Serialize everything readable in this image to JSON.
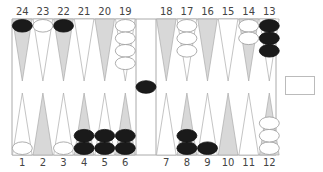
{
  "game": "backgammon",
  "colors": {
    "black_checker": "#1a1a1a",
    "white_checker": "#ffffff",
    "dark_point": "#d8d8d8",
    "light_point": "#ffffff",
    "board_line": "#aaaaaa",
    "label": "#444444"
  },
  "top_labels": [
    "24",
    "23",
    "22",
    "21",
    "20",
    "19",
    "18",
    "17",
    "16",
    "15",
    "14",
    "13"
  ],
  "bottom_labels": [
    "1",
    "2",
    "3",
    "4",
    "5",
    "6",
    "7",
    "8",
    "9",
    "10",
    "11",
    "12"
  ],
  "points": {
    "1": {
      "color": "white",
      "count": 1
    },
    "2": {
      "color": "none",
      "count": 0
    },
    "3": {
      "color": "white",
      "count": 1
    },
    "4": {
      "color": "black",
      "count": 2
    },
    "5": {
      "color": "black",
      "count": 2
    },
    "6": {
      "color": "black",
      "count": 2
    },
    "7": {
      "color": "none",
      "count": 0
    },
    "8": {
      "color": "black",
      "count": 2
    },
    "9": {
      "color": "black",
      "count": 1
    },
    "10": {
      "color": "none",
      "count": 0
    },
    "11": {
      "color": "none",
      "count": 0
    },
    "12": {
      "color": "white",
      "count": 3
    },
    "13": {
      "color": "black",
      "count": 3
    },
    "14": {
      "color": "white",
      "count": 2
    },
    "15": {
      "color": "none",
      "count": 0
    },
    "16": {
      "color": "none",
      "count": 0
    },
    "17": {
      "color": "white",
      "count": 3
    },
    "18": {
      "color": "none",
      "count": 0
    },
    "19": {
      "color": "white",
      "count": 4
    },
    "20": {
      "color": "none",
      "count": 0
    },
    "21": {
      "color": "none",
      "count": 0
    },
    "22": {
      "color": "black",
      "count": 1
    },
    "23": {
      "color": "white",
      "count": 1
    },
    "24": {
      "color": "black",
      "count": 1
    }
  },
  "bar": {
    "black": 1,
    "white": 0
  },
  "doubling_cube": {
    "value": ""
  }
}
